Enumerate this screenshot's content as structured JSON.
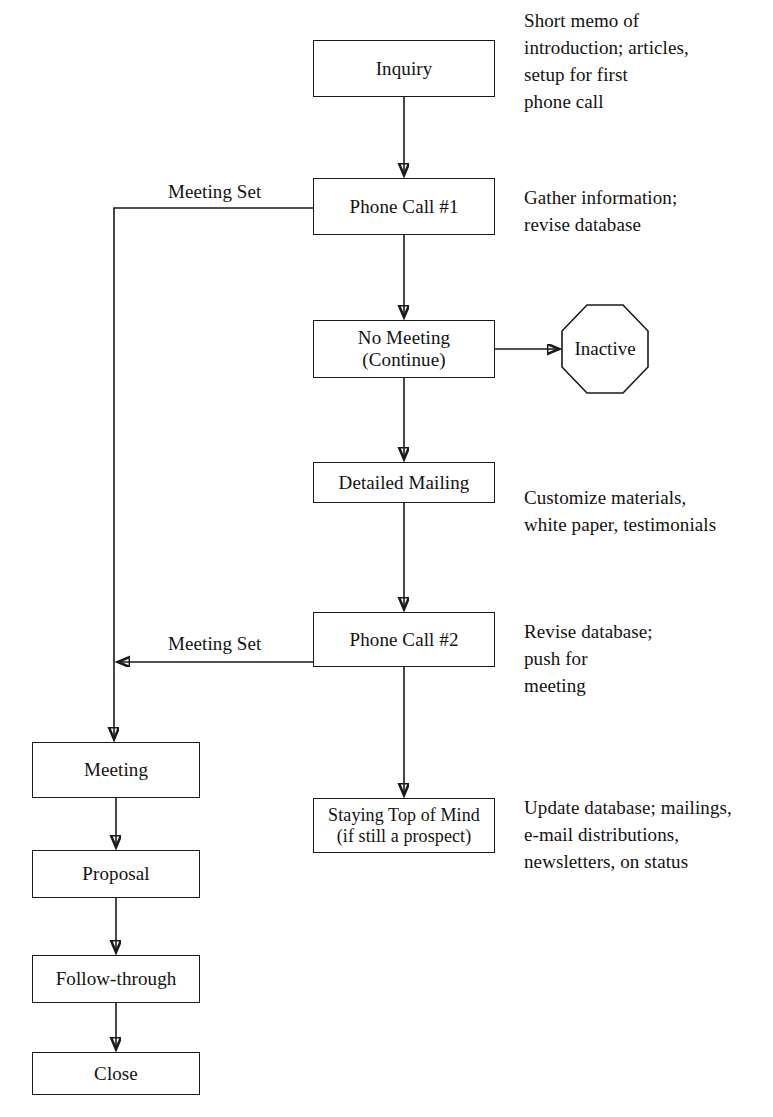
{
  "diagram": {
    "nodes": [
      {
        "id": "inquiry",
        "label": "Inquiry",
        "shape": "rect"
      },
      {
        "id": "phone_call_1",
        "label": "Phone Call #1",
        "shape": "rect"
      },
      {
        "id": "no_meeting",
        "label_line1": "No Meeting",
        "label_line2": "(Continue)",
        "shape": "rect"
      },
      {
        "id": "inactive",
        "label": "Inactive",
        "shape": "octagon"
      },
      {
        "id": "detailed_mailing",
        "label": "Detailed Mailing",
        "shape": "rect"
      },
      {
        "id": "phone_call_2",
        "label": "Phone Call #2",
        "shape": "rect"
      },
      {
        "id": "staying_top_of_mind",
        "label_line1": "Staying Top of Mind",
        "label_line2": "(if still a prospect)",
        "shape": "rect"
      },
      {
        "id": "meeting",
        "label": "Meeting",
        "shape": "rect"
      },
      {
        "id": "proposal",
        "label": "Proposal",
        "shape": "rect"
      },
      {
        "id": "follow_through",
        "label": "Follow-through",
        "shape": "rect"
      },
      {
        "id": "close",
        "label": "Close",
        "shape": "rect"
      }
    ],
    "edge_labels": {
      "meeting_set_1": "Meeting Set",
      "meeting_set_2": "Meeting Set"
    },
    "annotations": {
      "inquiry": "Short memo of\nintroduction; articles,\nsetup for first\nphone call",
      "phone_call_1": "Gather information;\nrevise database",
      "detailed_mailing": "Customize materials,\nwhite paper, testimonials",
      "phone_call_2": "Revise database;\npush for\nmeeting",
      "staying_top_of_mind": "Update database; mailings,\ne-mail distributions,\nnewsletters, on status"
    },
    "colors": {
      "stroke": "#1a1a1a",
      "text": "#121212",
      "background": "#ffffff"
    }
  }
}
